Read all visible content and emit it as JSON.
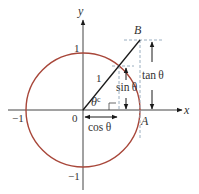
{
  "diagram": {
    "colors": {
      "circle": "#a8473a",
      "axes": "#444444",
      "line": "#1a1a1a",
      "dashed": "#9aaec0",
      "text": "#333333"
    },
    "axis_labels": {
      "x": "x",
      "y": "y"
    },
    "ticks": {
      "y_pos": "1",
      "y_neg": "−1",
      "x_neg": "−1",
      "origin": "0"
    },
    "points": {
      "B": "B",
      "A": "A"
    },
    "labels": {
      "radius": "1",
      "angle": "θ",
      "angle_sup": "c",
      "sin": "sin θ",
      "cos": "cos θ",
      "tan": "tan θ"
    }
  }
}
